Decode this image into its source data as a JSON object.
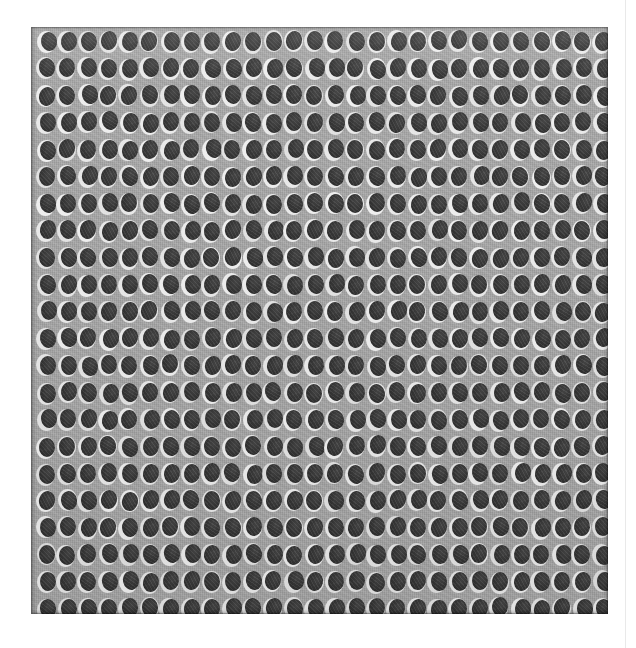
{
  "image": {
    "kind": "micrograph",
    "subject": "perforated metal plate with ordered array of elliptical through-holes",
    "width_px": 636,
    "height_px": 648,
    "background_color": "#ffffff",
    "caption": ""
  },
  "page_rule": {
    "present": true,
    "x_px": 625,
    "color": "#e9e9e9",
    "width_px": 1
  },
  "plate": {
    "left_px": 31,
    "top_px": 27,
    "width_px": 577,
    "height_px": 587,
    "surface_color": "#a8a8a8",
    "surface_color_light": "#b4b4b4",
    "surface_color_dark": "#989898",
    "rim_color": "#6e6e6e"
  },
  "holes": {
    "columns": 28,
    "rows": 22,
    "spacing_x_px": 20.6,
    "spacing_y_px": 27.0,
    "origin_x_px": 46,
    "origin_y_px": 42,
    "pit_width_px": 16,
    "pit_height_px": 19,
    "pit_color": "#3a3a3a",
    "ring_color": "#efefef",
    "ring_width_px": 19,
    "ring_height_px": 22,
    "highlight_direction": "left",
    "total_count": 616
  },
  "scale_bar": {
    "present": false,
    "label": ""
  },
  "labels": {
    "title": "",
    "annotations": []
  }
}
